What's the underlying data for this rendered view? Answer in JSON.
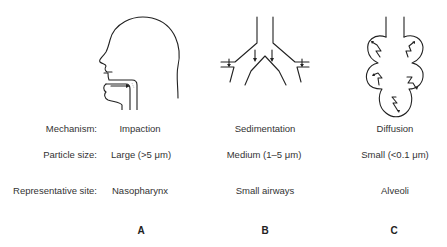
{
  "row_labels": {
    "mechanism": "Mechanism:",
    "particle_size": "Particle size:",
    "site": "Representative site:"
  },
  "columns": [
    {
      "letter": "A",
      "figure": "head-sagittal",
      "mechanism": "Impaction",
      "particle_size": "Large (>5 μm)",
      "site": "Nasopharynx"
    },
    {
      "letter": "B",
      "figure": "airway-bifurcation",
      "mechanism": "Sedimentation",
      "particle_size": "Medium (1–5 μm)",
      "site": "Small airways"
    },
    {
      "letter": "C",
      "figure": "alveolar-sac",
      "mechanism": "Diffusion",
      "particle_size": "Small (<0.1 μm)",
      "site": "Alveoli"
    }
  ]
}
